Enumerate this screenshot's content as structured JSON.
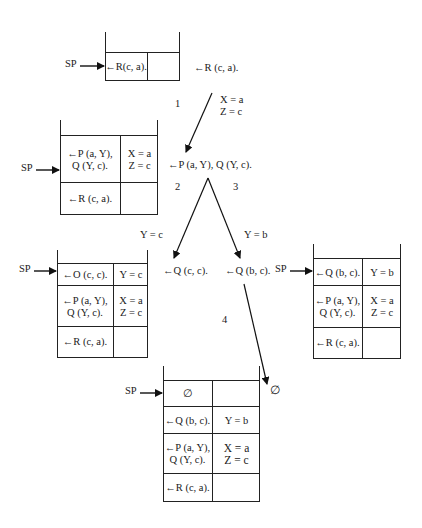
{
  "sp_label": "SP",
  "stacks": [
    {
      "id": "stack-1",
      "rows": [
        {
          "goal": "←R(c, a).",
          "binding": ""
        }
      ]
    },
    {
      "id": "stack-2",
      "rows": [
        {
          "goal_line1": "←P (a, Y),",
          "goal_line2": "Q (Y, c).",
          "binding_line1": "X = a",
          "binding_line2": "Z = c"
        },
        {
          "goal": "←R (c, a).",
          "binding": ""
        }
      ]
    },
    {
      "id": "stack-3",
      "rows": [
        {
          "goal": "←O (c, c).",
          "binding": "Y = c"
        },
        {
          "goal_line1": "←P (a, Y),",
          "goal_line2": "Q (Y, c).",
          "binding_line1": "X = a",
          "binding_line2": "Z = c"
        },
        {
          "goal": "←R (c, a).",
          "binding": ""
        }
      ]
    },
    {
      "id": "stack-4",
      "rows": [
        {
          "goal": "←Q (b, c).",
          "binding": "Y = b"
        },
        {
          "goal_line1": "←P (a, Y),",
          "goal_line2": "Q (Y, c).",
          "binding_line1": "X = a",
          "binding_line2": "Z = c"
        },
        {
          "goal": "←R (c, a).",
          "binding": ""
        }
      ]
    },
    {
      "id": "stack-5",
      "rows": [
        {
          "goal": "∅",
          "binding": ""
        },
        {
          "goal": "←Q (b, c).",
          "binding": "Y = b"
        },
        {
          "goal_line1": "←P (a, Y),",
          "goal_line2": "Q (Y, c).",
          "binding_line1": "X = a",
          "binding_line2": "Z = c"
        },
        {
          "goal": "←R (c, a).",
          "binding": ""
        }
      ]
    }
  ],
  "tree": {
    "root_goal": "←R (c, a).",
    "step1": {
      "number": "1",
      "binding_line1": "X = a",
      "binding_line2": "Z = c"
    },
    "node2_goal": "←P (a, Y), Q (Y, c).",
    "branch_left": {
      "number": "2",
      "binding": "Y = c",
      "goal": "←Q (c, c)."
    },
    "branch_right": {
      "number": "3",
      "binding": "Y = b",
      "goal": "←Q (b, c)."
    },
    "step4": {
      "number": "4",
      "result": "∅"
    }
  },
  "colors": {
    "line": "#222222",
    "background": "#ffffff"
  }
}
